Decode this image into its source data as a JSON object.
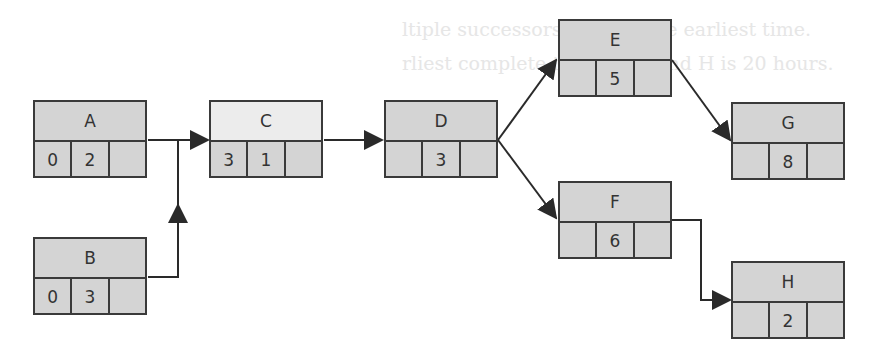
{
  "background_text": [
    "ltiple successors, choose the earliest time.",
    "rliest complete time for G and H is 20 hours."
  ],
  "nodes": {
    "A": {
      "label": "A",
      "cells": [
        "0",
        "2",
        ""
      ]
    },
    "B": {
      "label": "B",
      "cells": [
        "0",
        "3",
        ""
      ]
    },
    "C": {
      "label": "C",
      "cells": [
        "3",
        "1",
        ""
      ]
    },
    "D": {
      "label": "D",
      "cells": [
        "",
        "3",
        ""
      ]
    },
    "E": {
      "label": "E",
      "cells": [
        "",
        "5",
        ""
      ]
    },
    "F": {
      "label": "F",
      "cells": [
        "",
        "6",
        ""
      ]
    },
    "G": {
      "label": "G",
      "cells": [
        "",
        "8",
        ""
      ]
    },
    "H": {
      "label": "H",
      "cells": [
        "",
        "2",
        ""
      ]
    }
  },
  "edges": [
    {
      "from": "A",
      "to": "C"
    },
    {
      "from": "B",
      "to": "C"
    },
    {
      "from": "C",
      "to": "D"
    },
    {
      "from": "D",
      "to": "E"
    },
    {
      "from": "D",
      "to": "F"
    },
    {
      "from": "E",
      "to": "G"
    },
    {
      "from": "F",
      "to": "H"
    }
  ],
  "colors": {
    "node_fill": "#d4d4d4",
    "node_fill_light": "#ececec",
    "stroke": "#3a3a3a"
  }
}
